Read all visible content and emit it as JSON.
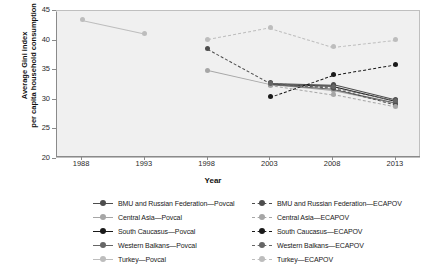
{
  "chart_data": {
    "type": "line",
    "title": "",
    "xlabel": "Year",
    "ylabel": "Average Gini index per capita household consumption",
    "xlim": [
      1986,
      2015
    ],
    "ylim": [
      20,
      45
    ],
    "xticks": [
      1988,
      1993,
      1998,
      2003,
      2008,
      2013
    ],
    "yticks": [
      20,
      25,
      30,
      35,
      40,
      45
    ],
    "grid": false,
    "legend_position": "bottom",
    "series": [
      {
        "name": "BMU and Russian Federation—Povcal",
        "style": "solid",
        "color": "#4d4d4d",
        "x": [
          2003,
          2008,
          2013
        ],
        "values": [
          32.9,
          32.6,
          30.0
        ]
      },
      {
        "name": "Central Asia—Povcal",
        "style": "solid",
        "color": "#a6a6a6",
        "x": [
          1998,
          2003,
          2008,
          2013
        ],
        "values": [
          35.0,
          32.6,
          31.6,
          29.4
        ]
      },
      {
        "name": "South Caucasus—Povcal",
        "style": "solid",
        "color": "#1a1a1a",
        "x": [
          2003,
          2008,
          2013
        ],
        "values": [
          32.6,
          32.3,
          29.8
        ]
      },
      {
        "name": "Western Balkans—Povcal",
        "style": "solid",
        "color": "#666666",
        "x": [
          2003,
          2008,
          2013
        ],
        "values": [
          32.7,
          31.9,
          29.6
        ]
      },
      {
        "name": "Turkey—Povcal",
        "style": "solid",
        "color": "#bdbdbd",
        "x": [
          1988,
          1993
        ],
        "values": [
          43.5,
          41.2
        ]
      },
      {
        "name": "BMU and Russian Federation—ECAPOV",
        "style": "dashed",
        "color": "#4d4d4d",
        "x": [
          1998,
          2003,
          2008,
          2013
        ],
        "values": [
          38.6,
          32.8,
          32.0,
          29.2
        ]
      },
      {
        "name": "Central Asia—ECAPOV",
        "style": "dashed",
        "color": "#a6a6a6",
        "x": [
          2003,
          2008,
          2013
        ],
        "values": [
          32.5,
          30.9,
          28.8
        ]
      },
      {
        "name": "South Caucasus—ECAPOV",
        "style": "dashed",
        "color": "#1a1a1a",
        "x": [
          2003,
          2008,
          2013
        ],
        "values": [
          30.5,
          34.2,
          36.0
        ]
      },
      {
        "name": "Western Balkans—ECAPOV",
        "style": "dashed",
        "color": "#666666",
        "x": [
          2003,
          2008,
          2013
        ],
        "values": [
          32.8,
          32.2,
          29.9
        ]
      },
      {
        "name": "Turkey—ECAPOV",
        "style": "dashed",
        "color": "#bdbdbd",
        "x": [
          1998,
          2003,
          2008,
          2013
        ],
        "values": [
          40.2,
          42.2,
          39.0,
          40.2
        ]
      }
    ],
    "colors": {
      "background": "#f0f0f0",
      "frame": "#bfbfbf",
      "axis": "#8a8a8a",
      "text": "#1a1a1a"
    }
  },
  "axis": {
    "x_title": "Year",
    "y_title_line1": "Average Gini index",
    "y_title_line2": "per capita household consumption",
    "x_tick_labels": [
      "1988",
      "1993",
      "1998",
      "2003",
      "2008",
      "2013"
    ],
    "y_tick_labels": [
      "20",
      "25",
      "30",
      "35",
      "40",
      "45"
    ]
  },
  "legend": {
    "left_column": [
      {
        "label": "BMU and Russian Federation—Povcal",
        "color": "#4d4d4d",
        "style": "solid"
      },
      {
        "label": "Central Asia—Povcal",
        "color": "#a6a6a6",
        "style": "solid"
      },
      {
        "label": "South Caucasus—Povcal",
        "color": "#1a1a1a",
        "style": "solid"
      },
      {
        "label": "Western Balkans—Povcal",
        "color": "#666666",
        "style": "solid"
      },
      {
        "label": "Turkey—Povcal",
        "color": "#bdbdbd",
        "style": "solid"
      }
    ],
    "right_column": [
      {
        "label": "BMU and Russian Federation—ECAPOV",
        "color": "#4d4d4d",
        "style": "dashed"
      },
      {
        "label": "Central Asia—ECAPOV",
        "color": "#a6a6a6",
        "style": "dashed"
      },
      {
        "label": "South Caucasus—ECAPOV",
        "color": "#1a1a1a",
        "style": "dashed"
      },
      {
        "label": "Western Balkans—ECAPOV",
        "color": "#666666",
        "style": "dashed"
      },
      {
        "label": "Turkey—ECAPOV",
        "color": "#bdbdbd",
        "style": "dashed"
      }
    ]
  }
}
